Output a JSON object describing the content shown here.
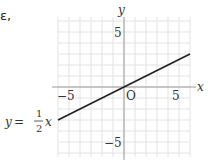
{
  "cropped_text": "ε,",
  "graph": {
    "x_axis_label": "x",
    "y_axis_label": "y",
    "origin_label": "O",
    "x_ticks": [
      "−5",
      "5"
    ],
    "y_ticks": [
      "5",
      "−5"
    ],
    "equation": {
      "lhs": "y",
      "eq": "=",
      "numerator": "1",
      "denominator": "2",
      "var": "x"
    }
  },
  "chart_data": {
    "type": "line",
    "title": "",
    "xlabel": "x",
    "ylabel": "y",
    "xlim": [
      -6,
      6
    ],
    "ylim": [
      -6,
      6
    ],
    "grid": true,
    "series": [
      {
        "name": "y = 1/2 x",
        "x": [
          -6,
          6
        ],
        "y": [
          -3,
          3
        ]
      }
    ],
    "annotations": [
      "y = 1/2 x",
      "O"
    ],
    "tick_labels": {
      "x": [
        -5,
        5
      ],
      "y": [
        5,
        -5
      ]
    }
  },
  "colors": {
    "grid": "#e2e2e2",
    "axis": "#9a9a9a",
    "line": "#222222",
    "text": "#333333"
  }
}
